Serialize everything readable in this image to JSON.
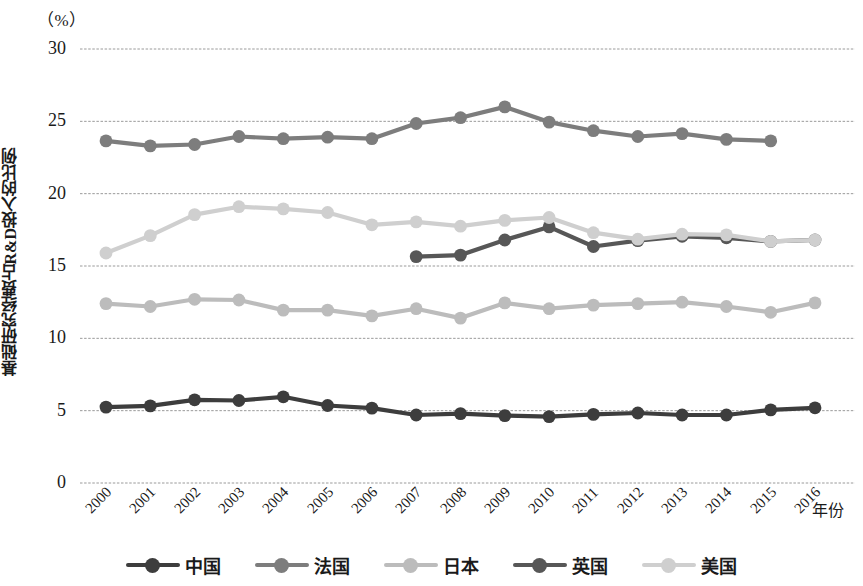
{
  "chart_data": {
    "type": "line",
    "title": "",
    "unit_note": "（%）",
    "xlabel": "年份",
    "ylabel": "基础研究经费占R&D投入的比例",
    "grid": true,
    "legend_position": "bottom",
    "ylim": [
      0,
      30
    ],
    "yticks": [
      0,
      5,
      10,
      15,
      20,
      25,
      30
    ],
    "categories": [
      "2000",
      "2001",
      "2002",
      "2003",
      "2004",
      "2005",
      "2006",
      "2007",
      "2008",
      "2009",
      "2010",
      "2011",
      "2012",
      "2013",
      "2014",
      "2015",
      "2016"
    ],
    "series": [
      {
        "name": "中国",
        "color": "#3d3d3d",
        "values": [
          5.25,
          5.33,
          5.75,
          5.7,
          5.96,
          5.36,
          5.18,
          4.7,
          4.8,
          4.66,
          4.59,
          4.74,
          4.84,
          4.7,
          4.7,
          5.05,
          5.2
        ]
      },
      {
        "name": "法国",
        "color": "#7d7d7d",
        "values": [
          23.65,
          23.3,
          23.4,
          23.95,
          23.8,
          23.9,
          23.8,
          24.85,
          25.25,
          26.0,
          24.95,
          24.35,
          23.95,
          24.15,
          23.75,
          23.65,
          null
        ]
      },
      {
        "name": "日本",
        "color": "#bcbcbc",
        "values": [
          12.4,
          12.2,
          12.7,
          12.65,
          11.95,
          11.95,
          11.55,
          12.05,
          11.4,
          12.45,
          12.05,
          12.3,
          12.4,
          12.5,
          12.2,
          11.8,
          12.45
        ]
      },
      {
        "name": "英国",
        "color": "#575757",
        "values": [
          null,
          null,
          null,
          null,
          null,
          null,
          null,
          15.65,
          15.75,
          16.8,
          17.7,
          16.35,
          16.75,
          17.05,
          16.95,
          16.7,
          16.8
        ]
      },
      {
        "name": "美国",
        "color": "#cfcfcf",
        "values": [
          15.9,
          17.1,
          18.55,
          19.1,
          18.95,
          18.7,
          17.85,
          18.05,
          17.75,
          18.15,
          18.35,
          17.3,
          16.85,
          17.2,
          17.15,
          16.7,
          16.8
        ]
      }
    ]
  },
  "axes": {
    "unit_label": "（%）",
    "y_title": "基础研究经费占R&D投入的比例",
    "x_title": "年份",
    "y_tick_labels": [
      "30",
      "25",
      "20",
      "15",
      "10",
      "5",
      "0"
    ],
    "x_tick_labels": [
      "2000",
      "2001",
      "2002",
      "2003",
      "2004",
      "2005",
      "2006",
      "2007",
      "2008",
      "2009",
      "2010",
      "2011",
      "2012",
      "2013",
      "2014",
      "2015",
      "2016"
    ]
  },
  "legend": {
    "items": [
      {
        "label": "中国",
        "color": "#3d3d3d"
      },
      {
        "label": "法国",
        "color": "#7d7d7d"
      },
      {
        "label": "日本",
        "color": "#bcbcbc"
      },
      {
        "label": "英国",
        "color": "#575757"
      },
      {
        "label": "美国",
        "color": "#cfcfcf"
      }
    ]
  }
}
